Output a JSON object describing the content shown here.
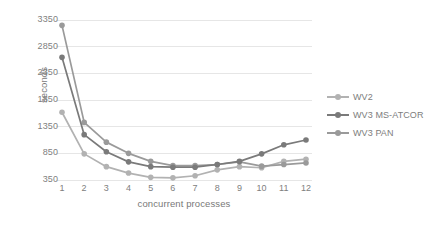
{
  "chart_data": {
    "type": "line",
    "title": "",
    "xlabel": "concurrent processes",
    "ylabel": "seconds",
    "categories": [
      1,
      2,
      3,
      4,
      5,
      6,
      7,
      8,
      9,
      10,
      11,
      12
    ],
    "ytick_labels": [
      "350",
      "850",
      "1350",
      "1850",
      "2350",
      "2850",
      "3350"
    ],
    "ylim": [
      350,
      3350
    ],
    "grid": "horizontal",
    "legend_position": "right",
    "series": [
      {
        "name": "WV2",
        "color": "#b2b2b2",
        "values": [
          1620,
          840,
          600,
          480,
          400,
          390,
          430,
          540,
          600,
          580,
          700,
          740
        ]
      },
      {
        "name": "WV3 MS-ATCOR",
        "color": "#7a7a7a",
        "values": [
          2650,
          1200,
          880,
          690,
          600,
          590,
          590,
          640,
          700,
          840,
          1010,
          1100
        ]
      },
      {
        "name": "WV3 PAN",
        "color": "#9a9a9a",
        "values": [
          3250,
          1430,
          1060,
          850,
          700,
          620,
          620,
          640,
          690,
          610,
          640,
          670
        ]
      }
    ]
  },
  "axes": {
    "y_title": "seconds",
    "x_title": "concurrent processes"
  },
  "colors": {
    "gridline": "#e6e6e6",
    "tick_text": "#808080",
    "title_text": "#787878",
    "background": "#ffffff"
  }
}
